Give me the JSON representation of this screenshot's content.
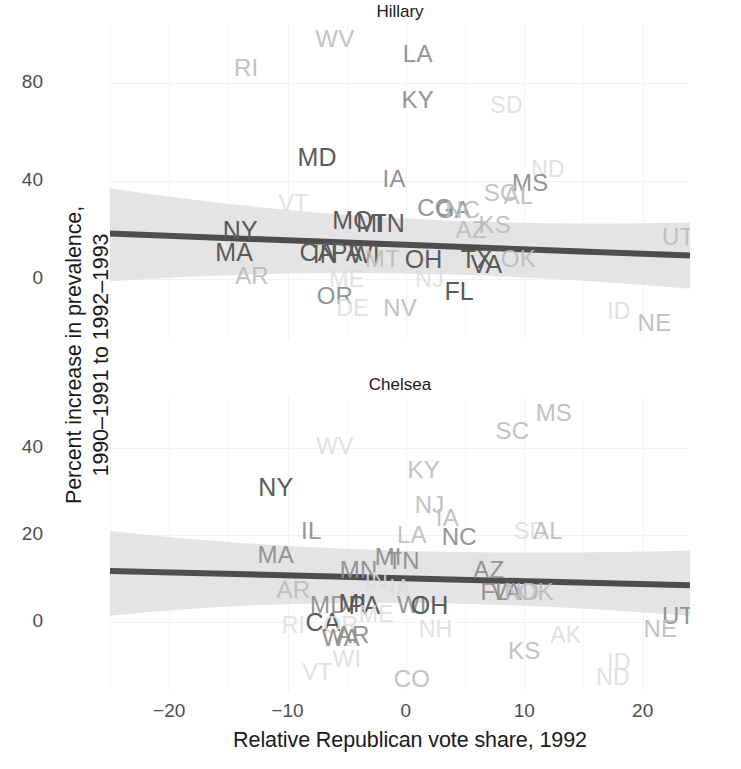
{
  "axes": {
    "ylabel_line1": "Percent increase in prevalence,",
    "ylabel_line2": "1990–1991 to 1992–1993",
    "xlabel": "Relative Republican vote share, 1992",
    "xticks": [
      "-20",
      "-10",
      "0",
      "10",
      "20"
    ],
    "yticks_hillary": [
      "80",
      "40",
      "0"
    ],
    "yticks_chelsea": [
      "40",
      "20",
      "0"
    ]
  },
  "panels": {
    "hillary": {
      "title": "Hillary"
    },
    "chelsea": {
      "title": "Chelsea"
    }
  },
  "colors": {
    "trend_line": "#4d4d4d",
    "confidence_band": "#d9d9d9",
    "grid": "#f2f2f5",
    "text": "#4d4d4d",
    "title": "#1a1a1a",
    "background": "#ffffff"
  },
  "chart_data": {
    "type": "scatter",
    "title": "",
    "xlabel": "Relative Republican vote share, 1992",
    "ylabel": "Percent increase in prevalence, 1990–1991 to 1992–1993",
    "xlim": [
      -25,
      24
    ],
    "grid": true,
    "legend": "none",
    "facets": [
      {
        "name": "Hillary",
        "ylim": [
          -25,
          105
        ],
        "yticks": [
          0,
          40,
          80
        ],
        "xticks": [
          -20,
          -10,
          0,
          10,
          20
        ],
        "point_label_field": "state",
        "points": [
          {
            "state": "WV",
            "x": -6.0,
            "y": 98.0,
            "shade": "light"
          },
          {
            "state": "LA",
            "x": 1.0,
            "y": 92.0,
            "shade": "mid"
          },
          {
            "state": "RI",
            "x": -13.5,
            "y": 86.0,
            "shade": "light"
          },
          {
            "state": "KY",
            "x": 1.0,
            "y": 73.0,
            "shade": "mid"
          },
          {
            "state": "SD",
            "x": 8.5,
            "y": 71.0,
            "shade": "vlight"
          },
          {
            "state": "MD",
            "x": -7.5,
            "y": 50.0,
            "shade": "dark"
          },
          {
            "state": "ND",
            "x": 12.0,
            "y": 45.0,
            "shade": "vlight"
          },
          {
            "state": "IA",
            "x": -1.0,
            "y": 41.0,
            "shade": "mid"
          },
          {
            "state": "MS",
            "x": 10.5,
            "y": 39.0,
            "shade": "mid"
          },
          {
            "state": "SC",
            "x": 8.0,
            "y": 35.0,
            "shade": "light"
          },
          {
            "state": "AL",
            "x": 9.5,
            "y": 34.0,
            "shade": "light"
          },
          {
            "state": "VT",
            "x": -9.5,
            "y": 31.0,
            "shade": "vlight"
          },
          {
            "state": "CO",
            "x": 2.5,
            "y": 29.0,
            "shade": "mid"
          },
          {
            "state": "GA",
            "x": 4.0,
            "y": 28.0,
            "shade": "mid"
          },
          {
            "state": "NC",
            "x": 4.8,
            "y": 28.0,
            "shade": "light"
          },
          {
            "state": "MO",
            "x": -4.5,
            "y": 24.0,
            "shade": "dark"
          },
          {
            "state": "MI",
            "x": -3.0,
            "y": 23.0,
            "shade": "dark"
          },
          {
            "state": "TN",
            "x": -1.5,
            "y": 23.0,
            "shade": "dark"
          },
          {
            "state": "KS",
            "x": 7.5,
            "y": 22.0,
            "shade": "light"
          },
          {
            "state": "AZ",
            "x": 5.5,
            "y": 20.0,
            "shade": "light"
          },
          {
            "state": "NY",
            "x": -14.0,
            "y": 20.0,
            "shade": "dark"
          },
          {
            "state": "UT",
            "x": 23.0,
            "y": 17.0,
            "shade": "light"
          },
          {
            "state": "MA",
            "x": -14.5,
            "y": 11.0,
            "shade": "dark"
          },
          {
            "state": "CA",
            "x": -7.5,
            "y": 11.0,
            "shade": "dark"
          },
          {
            "state": "IN",
            "x": -6.8,
            "y": 10.0,
            "shade": "dark"
          },
          {
            "state": "PA",
            "x": -5.0,
            "y": 11.0,
            "shade": "dark"
          },
          {
            "state": "WI",
            "x": -3.5,
            "y": 10.0,
            "shade": "dark"
          },
          {
            "state": "MT",
            "x": -2.0,
            "y": 8.0,
            "shade": "light"
          },
          {
            "state": "OH",
            "x": 1.5,
            "y": 8.0,
            "shade": "dark"
          },
          {
            "state": "TX",
            "x": 6.0,
            "y": 8.0,
            "shade": "dark"
          },
          {
            "state": "VA",
            "x": 6.8,
            "y": 6.0,
            "shade": "dark"
          },
          {
            "state": "OK",
            "x": 9.5,
            "y": 8.0,
            "shade": "light"
          },
          {
            "state": "AR",
            "x": -13.0,
            "y": 1.0,
            "shade": "light"
          },
          {
            "state": "ME",
            "x": -5.0,
            "y": 0.0,
            "shade": "vlight"
          },
          {
            "state": "NJ",
            "x": 2.0,
            "y": 0.0,
            "shade": "vlight"
          },
          {
            "state": "FL",
            "x": 4.5,
            "y": -5.0,
            "shade": "dark"
          },
          {
            "state": "OR",
            "x": -6.0,
            "y": -7.0,
            "shade": "mid"
          },
          {
            "state": "DE",
            "x": -4.5,
            "y": -12.0,
            "shade": "vlight"
          },
          {
            "state": "NV",
            "x": -0.5,
            "y": -12.0,
            "shade": "light"
          },
          {
            "state": "ID",
            "x": 18.0,
            "y": -13.0,
            "shade": "vlight"
          },
          {
            "state": "NE",
            "x": 21.0,
            "y": -18.0,
            "shade": "light"
          }
        ],
        "trend": {
          "x0": -25,
          "y0": 18.5,
          "x1": 24,
          "y1": 9.5
        },
        "band": {
          "x0": -25,
          "lo0": -1.0,
          "hi0": 37.0,
          "xm": -2,
          "lom": 7.0,
          "him": 20.0,
          "x1": 24,
          "lo1": -4.0,
          "hi1": 23.0
        }
      },
      {
        "name": "Chelsea",
        "ylim": [
          -16,
          52
        ],
        "yticks": [
          0,
          20,
          40
        ],
        "xticks": [
          -20,
          -10,
          0,
          10,
          20
        ],
        "point_label_field": "state",
        "points": [
          {
            "state": "MS",
            "x": 12.5,
            "y": 48.0,
            "shade": "light"
          },
          {
            "state": "SC",
            "x": 9.0,
            "y": 44.0,
            "shade": "light"
          },
          {
            "state": "WV",
            "x": -6.0,
            "y": 40.5,
            "shade": "vlight"
          },
          {
            "state": "KY",
            "x": 1.5,
            "y": 35.0,
            "shade": "light"
          },
          {
            "state": "NY",
            "x": -11.0,
            "y": 31.0,
            "shade": "dark"
          },
          {
            "state": "NJ",
            "x": 2.0,
            "y": 27.0,
            "shade": "light"
          },
          {
            "state": "IA",
            "x": 3.5,
            "y": 24.0,
            "shade": "light"
          },
          {
            "state": "IL",
            "x": -8.0,
            "y": 21.0,
            "shade": "mid"
          },
          {
            "state": "SD",
            "x": 10.5,
            "y": 21.0,
            "shade": "vlight"
          },
          {
            "state": "AL",
            "x": 12.0,
            "y": 21.0,
            "shade": "light"
          },
          {
            "state": "LA",
            "x": 0.5,
            "y": 20.0,
            "shade": "light"
          },
          {
            "state": "NC",
            "x": 4.5,
            "y": 19.5,
            "shade": "mid"
          },
          {
            "state": "MA",
            "x": -11.0,
            "y": 15.5,
            "shade": "mid"
          },
          {
            "state": "MI",
            "x": -1.5,
            "y": 15.0,
            "shade": "mid"
          },
          {
            "state": "TN",
            "x": -0.2,
            "y": 14.0,
            "shade": "mid"
          },
          {
            "state": "MN",
            "x": -4.0,
            "y": 12.0,
            "shade": "mid"
          },
          {
            "state": "AZ",
            "x": 7.0,
            "y": 12.0,
            "shade": "mid"
          },
          {
            "state": "IN",
            "x": -2.5,
            "y": 9.5,
            "shade": "vlight"
          },
          {
            "state": "IA2",
            "x": -0.5,
            "y": 8.0,
            "shade": "vlight"
          },
          {
            "state": "AR",
            "x": -9.5,
            "y": 7.5,
            "shade": "light"
          },
          {
            "state": "FL",
            "x": 7.5,
            "y": 7.0,
            "shade": "mid"
          },
          {
            "state": "VA",
            "x": 8.5,
            "y": 7.0,
            "shade": "mid"
          },
          {
            "state": "ND",
            "x": 9.8,
            "y": 7.0,
            "shade": "light"
          },
          {
            "state": "OK",
            "x": 11.0,
            "y": 7.0,
            "shade": "light"
          },
          {
            "state": "MD",
            "x": -6.5,
            "y": 4.0,
            "shade": "mid"
          },
          {
            "state": "MI2",
            "x": -4.5,
            "y": 4.5,
            "shade": "dark"
          },
          {
            "state": "PA",
            "x": -3.5,
            "y": 4.0,
            "shade": "dark"
          },
          {
            "state": "WI",
            "x": 0.5,
            "y": 4.0,
            "shade": "mid"
          },
          {
            "state": "OH",
            "x": 2.0,
            "y": 4.0,
            "shade": "dark"
          },
          {
            "state": "ME",
            "x": -2.5,
            "y": 2.0,
            "shade": "vlight"
          },
          {
            "state": "UT",
            "x": 23.0,
            "y": 1.5,
            "shade": "mid"
          },
          {
            "state": "CA",
            "x": -7.0,
            "y": 0.0,
            "shade": "dark"
          },
          {
            "state": "RI",
            "x": -9.5,
            "y": -0.5,
            "shade": "vlight"
          },
          {
            "state": "OR",
            "x": -5.5,
            "y": -0.5,
            "shade": "vlight"
          },
          {
            "state": "NH",
            "x": 2.5,
            "y": -1.5,
            "shade": "vlight"
          },
          {
            "state": "NE",
            "x": 21.5,
            "y": -1.5,
            "shade": "light"
          },
          {
            "state": "WA",
            "x": -5.5,
            "y": -3.5,
            "shade": "mid"
          },
          {
            "state": "AR2",
            "x": -4.5,
            "y": -3.0,
            "shade": "mid"
          },
          {
            "state": "AK",
            "x": 13.5,
            "y": -3.0,
            "shade": "vlight"
          },
          {
            "state": "KS",
            "x": 10.0,
            "y": -6.5,
            "shade": "light"
          },
          {
            "state": "ID",
            "x": 18.0,
            "y": -9.0,
            "shade": "vlight"
          },
          {
            "state": "WI2",
            "x": -5.0,
            "y": -8.5,
            "shade": "vlight"
          },
          {
            "state": "VT",
            "x": -7.5,
            "y": -11.5,
            "shade": "vlight"
          },
          {
            "state": "CO",
            "x": 0.5,
            "y": -13.0,
            "shade": "light"
          },
          {
            "state": "ND2",
            "x": 17.5,
            "y": -12.5,
            "shade": "vlight"
          }
        ],
        "trend": {
          "x0": -25,
          "y0": 11.8,
          "x1": 24,
          "y1": 8.5
        },
        "band": {
          "x0": -25,
          "lo0": 1.5,
          "hi0": 21.0,
          "xm": -4,
          "lom": 7.5,
          "him": 14.5,
          "x1": 24,
          "lo1": 1.5,
          "hi1": 16.5
        }
      }
    ]
  }
}
